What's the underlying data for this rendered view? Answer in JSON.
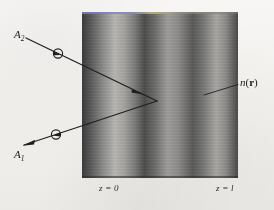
{
  "figure": {
    "background_color": "#f4f3f1",
    "ink_color": "#222222"
  },
  "slab": {
    "name": "graded-index-slab",
    "left_boundary_label": "z = 0",
    "right_boundary_label": "z = l",
    "index_label_n": "n",
    "index_label_open_paren": "(",
    "index_label_r": "r",
    "index_label_close_paren": ")",
    "geometry": {
      "x": 82,
      "y": 12,
      "width": 156,
      "height": 166
    },
    "gradient_stops": [
      {
        "pos": "0%",
        "color": "#3b3b3b"
      },
      {
        "pos": "6%",
        "color": "#5c5c5c"
      },
      {
        "pos": "14%",
        "color": "#8e8e8c"
      },
      {
        "pos": "21%",
        "color": "#b4b3b0"
      },
      {
        "pos": "27%",
        "color": "#a3a2a0"
      },
      {
        "pos": "34%",
        "color": "#7a7a79"
      },
      {
        "pos": "40%",
        "color": "#4d4d4d"
      },
      {
        "pos": "47%",
        "color": "#6e6e6d"
      },
      {
        "pos": "55%",
        "color": "#9d9c9a"
      },
      {
        "pos": "62%",
        "color": "#8a8988"
      },
      {
        "pos": "71%",
        "color": "#5a5a59"
      },
      {
        "pos": "78%",
        "color": "#777776"
      },
      {
        "pos": "86%",
        "color": "#a6a5a2"
      },
      {
        "pos": "92%",
        "color": "#8c8b89"
      },
      {
        "pos": "100%",
        "color": "#494948"
      }
    ]
  },
  "rays": {
    "incoming": {
      "name": "incoming-ray-A2",
      "label": "A",
      "label_subscript": "2",
      "path": "M 26,38 L 157,101",
      "direction_marker_at": {
        "x": 58,
        "y": 53
      },
      "arrowhead_at": {
        "x": 140,
        "y": 93
      }
    },
    "outgoing": {
      "name": "outgoing-ray-A1",
      "label": "A",
      "label_subscript": "1",
      "path": "M 157,101 L 24,145",
      "direction_marker_at": {
        "x": 54,
        "y": 134
      },
      "arrowhead_at": {
        "x": 24,
        "y": 145
      }
    },
    "turning_point": {
      "x": 157,
      "y": 101
    }
  },
  "leader": {
    "name": "index-label-leader-line",
    "path": "M 238,85 L 205,95"
  }
}
